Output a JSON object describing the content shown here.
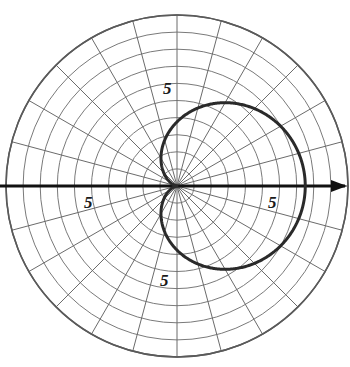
{
  "figure": {
    "kind": "polar-grid-plot",
    "width": 350,
    "height": 367,
    "background": "#ffffff"
  },
  "colors": {
    "grid": "#6b6b6b",
    "grid_inner": "#7a7a7a",
    "outer_circle": "#5a5a5a",
    "axis": "#111111",
    "curve": "#2a2a2a",
    "label": "#1a1a1a"
  },
  "geometry": {
    "center_x": 177,
    "center_y": 186,
    "outer_radius": 171,
    "ring_count": 10,
    "ring_spacing_px": 17.1,
    "spoke_count": 24,
    "spoke_step_deg": 15,
    "axis_left_x": 0,
    "axis_right_x": 347,
    "arrow_tip_x": 347,
    "arrow_length": 16,
    "arrow_half_width": 6
  },
  "axis": {
    "name": "horizontal-polar-axis",
    "has_arrow": true,
    "arrow_direction": "right",
    "stroke_width": 3
  },
  "labels": [
    {
      "id": "label-top",
      "text": "5",
      "x": 163,
      "y": 80,
      "anchor": "top-5-ring-label"
    },
    {
      "id": "label-left",
      "text": "5",
      "x": 84,
      "y": 194,
      "anchor": "left-5-ring-label"
    },
    {
      "id": "label-right",
      "text": "5",
      "x": 268,
      "y": 194,
      "anchor": "right-5-ring-label"
    },
    {
      "id": "label-bottom",
      "text": "5",
      "x": 160,
      "y": 272,
      "anchor": "bottom-5-ring-label"
    }
  ],
  "chart_data": {
    "type": "line",
    "coordinate_system": "polar",
    "title": "",
    "xlabel": "",
    "ylabel": "",
    "grid": true,
    "legend": false,
    "legend_position": "none",
    "r_axis": {
      "label_values": [
        5
      ],
      "label_text": "5",
      "ticks": [
        1,
        2,
        3,
        4,
        5,
        6,
        7,
        8,
        9,
        10
      ],
      "rlim": [
        0,
        10
      ],
      "rings_drawn": 10,
      "pixels_per_unit": 17.1
    },
    "theta_axis": {
      "spokes_deg": [
        0,
        15,
        30,
        45,
        60,
        75,
        90,
        105,
        120,
        135,
        150,
        165,
        180,
        195,
        210,
        225,
        240,
        255,
        270,
        285,
        300,
        315,
        330,
        345
      ],
      "step_deg": 15,
      "zero_direction": "east",
      "direction": "counterclockwise"
    },
    "series": [
      {
        "name": "cardioid",
        "equation": "r = a (1 + cos(theta))",
        "a": 3.75,
        "r_max": 7.5,
        "r_max_theta_deg": 0,
        "r_min": 0,
        "r_min_theta_deg": 180,
        "stroke": "#2a2a2a",
        "stroke_width": 3,
        "samples_theta_deg": [
          0,
          15,
          30,
          45,
          60,
          75,
          90,
          105,
          120,
          135,
          150,
          165,
          180,
          195,
          210,
          225,
          240,
          255,
          270,
          285,
          300,
          315,
          330,
          345,
          360
        ],
        "samples_r": [
          7.5,
          7.37,
          6.99,
          6.4,
          5.63,
          4.72,
          3.75,
          2.78,
          1.88,
          1.1,
          0.5,
          0.13,
          0,
          0.13,
          0.5,
          1.1,
          1.88,
          2.78,
          3.75,
          4.72,
          5.63,
          6.4,
          6.99,
          7.37,
          7.5
        ]
      }
    ]
  }
}
